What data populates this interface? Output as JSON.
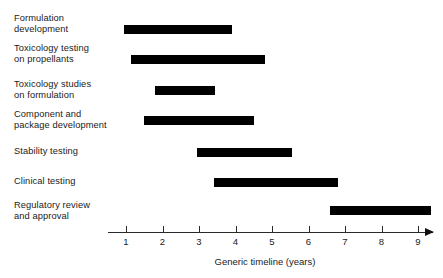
{
  "chart_data": {
    "type": "bar",
    "orientation": "horizontal",
    "subtype": "gantt",
    "title": "",
    "xlabel": "Generic timeline (years)",
    "ylabel": "",
    "xlim": [
      0.55,
      9.7
    ],
    "xticks": [
      1,
      2,
      3,
      4,
      5,
      6,
      7,
      8,
      9
    ],
    "xtick_labels": [
      "1",
      "2",
      "3",
      "4",
      "5",
      "6",
      "7",
      "8",
      "9"
    ],
    "grid": false,
    "legend": false,
    "axis_arrow": true,
    "bar_color": "#000000",
    "categories": [
      "Formulation development",
      "Toxicology testing on propellants",
      "Toxicology studies on formulation",
      "Component and package development",
      "Stability testing",
      "Clinical testing",
      "Regulatory review and approval"
    ],
    "tasks": [
      {
        "label": "Formulation\ndevelopment",
        "start": 0.95,
        "end": 3.9,
        "duration": 2.95
      },
      {
        "label": "Toxicology testing\non propellants",
        "start": 1.15,
        "end": 4.8,
        "duration": 3.65
      },
      {
        "label": "Toxicology studies\non formulation",
        "start": 1.8,
        "end": 3.45,
        "duration": 1.65
      },
      {
        "label": "Component and\npackage development",
        "start": 1.5,
        "end": 4.5,
        "duration": 3.0
      },
      {
        "label": "Stability testing",
        "start": 2.95,
        "end": 5.55,
        "duration": 2.6
      },
      {
        "label": "Clinical testing",
        "start": 3.4,
        "end": 6.8,
        "duration": 3.4
      },
      {
        "label": "Regulatory review\nand approval",
        "start": 6.6,
        "end": 9.35,
        "duration": 2.75
      }
    ]
  }
}
